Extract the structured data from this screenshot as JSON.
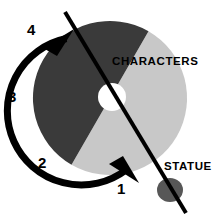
{
  "figure": {
    "background_color": "#ffffff"
  },
  "disc": {
    "center_x": 110,
    "center_y": 98,
    "radius": 77,
    "hole_radius": 14,
    "hole_color": "#ffffff",
    "sectors": [
      {
        "name": "characters-sector",
        "label": "CHARACTERS",
        "color": "#c8c8c8",
        "start_angle_deg": -60,
        "end_angle_deg": 120
      },
      {
        "name": "dark-sector",
        "label": "",
        "color": "#3a3a3a",
        "start_angle_deg": 120,
        "end_angle_deg": 300
      }
    ]
  },
  "labels": {
    "characters": "CHARACTERS",
    "statue": "STATUE",
    "steps": [
      "1",
      "2",
      "3",
      "4"
    ]
  },
  "rotation_arrow": {
    "name": "rotation-arrow",
    "color": "#000000",
    "direction": "counterclockwise",
    "stroke_width": 7,
    "step_order": [
      "1",
      "2",
      "3",
      "4"
    ]
  },
  "tonearm": {
    "name": "tonearm-line",
    "color": "#000000",
    "stroke_width": 4,
    "x1": 65,
    "y1": 12,
    "x2": 186,
    "y2": 213
  },
  "statue_marker": {
    "name": "statue-ellipse",
    "color": "#575757",
    "cx": 170,
    "cy": 190,
    "rx": 13,
    "ry": 12
  },
  "colors": {
    "light_gray": "#c8c8c8",
    "dark_gray": "#3a3a3a",
    "marker_gray": "#575757",
    "ink": "#000000",
    "paper": "#ffffff"
  }
}
